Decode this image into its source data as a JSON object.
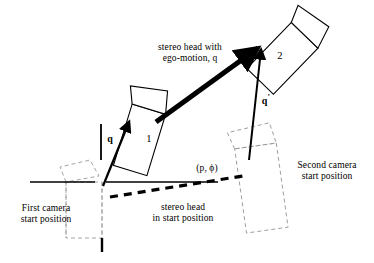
{
  "figure": {
    "background_color": "#ffffff",
    "line_color": "#000000",
    "ghost_color": "#8c8c8c"
  },
  "labels": {
    "ego_motion_line1": "stereo head with",
    "ego_motion_line2": "ego-motion, q",
    "vector_q": "q",
    "vector_q_prime": "q",
    "vector_q_prime_mark": "'",
    "camera_one": "1",
    "camera_two": "2",
    "pose_pair": "(p, ϕ)",
    "first_camera_line1": "First camera",
    "first_camera_line2": "start position",
    "second_camera_line1": "Second camera",
    "second_camera_line2": "start position",
    "start_pose_line1": "stereo head",
    "start_pose_line2": "in start position"
  },
  "geometry": {
    "baseline_left": {
      "x1": 30,
      "y1": 182,
      "x2": 95,
      "y2": 182
    },
    "baseline_right": {
      "x1": 106,
      "y1": 182,
      "x2": 218,
      "y2": 182
    },
    "dashed_pose_line": {
      "x1": 110,
      "y1": 197,
      "x2": 243,
      "y2": 176
    },
    "ego_motion_arrow": {
      "x1": 156,
      "y1": 122,
      "x2": 262,
      "y2": 45
    },
    "q_arrow": {
      "x1": 103,
      "y1": 185,
      "x2": 131,
      "y2": 117
    },
    "q_prime_arrow": {
      "x1": 249,
      "y1": 158,
      "x2": 262,
      "y2": 44
    },
    "tick_vertical_left": {
      "x1": 101,
      "y1": 124,
      "x2": 101,
      "y2": 160
    },
    "tick_below_box": {
      "x1": 102,
      "y1": 238,
      "x2": 102,
      "y2": 252
    }
  }
}
